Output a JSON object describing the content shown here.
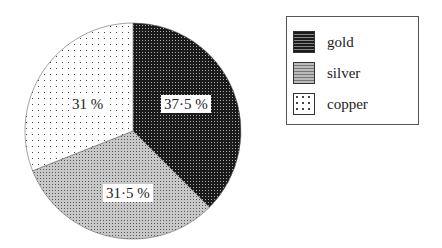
{
  "chart_data": {
    "type": "pie",
    "title": "",
    "categories": [
      "gold",
      "silver",
      "copper"
    ],
    "values": [
      37.5,
      31.5,
      31
    ],
    "labels": [
      "37·5 %",
      "31·5 %",
      "31 %"
    ],
    "legend_position": "upper right",
    "start_angle": "top, clockwise"
  },
  "legend": {
    "items": [
      {
        "label": "gold"
      },
      {
        "label": "silver"
      },
      {
        "label": "copper"
      }
    ]
  },
  "slice_labels": {
    "gold": "37·5 %",
    "silver": "31·5 %",
    "copper": "31 %"
  }
}
